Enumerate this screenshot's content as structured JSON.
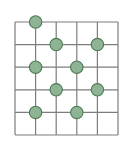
{
  "figure": {
    "type": "lattice-grid-diagram",
    "background_color": "#ffffff"
  },
  "grid": {
    "rows": 5,
    "columns": 5,
    "vertical_line_count": 6,
    "horizontal_line_count": 6,
    "line_color": "#7d7d7d",
    "line_width": 1.2,
    "origin_x": 15,
    "origin_y": 22,
    "cell_width": 20.6,
    "cell_height": 22.6,
    "x_positions": [
      15,
      35.6,
      56.2,
      76.8,
      97.4,
      118
    ],
    "y_positions": [
      22,
      44.6,
      67.2,
      89.8,
      112.4,
      135
    ]
  },
  "dots": {
    "fill_color": "#8fb494",
    "stroke_color": "#4d7a55",
    "radius": 6.2,
    "stroke_width": 1.1,
    "count": 9,
    "points": [
      {
        "label": "dot-1",
        "col": 1,
        "row": 0,
        "cx": 35.6,
        "cy": 22
      },
      {
        "label": "dot-2",
        "col": 2,
        "row": 1,
        "cx": 56.2,
        "cy": 44.6
      },
      {
        "label": "dot-3",
        "col": 4,
        "row": 1,
        "cx": 97.4,
        "cy": 44.6
      },
      {
        "label": "dot-4",
        "col": 1,
        "row": 2,
        "cx": 35.6,
        "cy": 67.2
      },
      {
        "label": "dot-5",
        "col": 3,
        "row": 2,
        "cx": 76.8,
        "cy": 67.2
      },
      {
        "label": "dot-6",
        "col": 2,
        "row": 3,
        "cx": 56.2,
        "cy": 89.8
      },
      {
        "label": "dot-7",
        "col": 4,
        "row": 3,
        "cx": 97.4,
        "cy": 89.8
      },
      {
        "label": "dot-8",
        "col": 1,
        "row": 4,
        "cx": 35.6,
        "cy": 112.4
      },
      {
        "label": "dot-9",
        "col": 3,
        "row": 4,
        "cx": 76.8,
        "cy": 112.4
      }
    ]
  }
}
